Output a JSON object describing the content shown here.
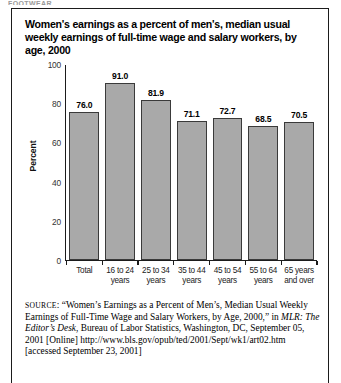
{
  "runhead": "FOOTWEAR",
  "card": {
    "title": "Women's earnings as a percent of men's, median usual weekly earnings of full-time wage and salary workers, by age, 2000"
  },
  "chart_data": {
    "type": "bar",
    "title": "Women's earnings as a percent of men's, median usual weekly earnings of full-time wage and salary workers, by age, 2000",
    "categories": [
      "Total",
      "16 to 24 years",
      "25 to 34 years",
      "35 to 44 years",
      "45 to 54 years",
      "55 to 64 years",
      "65 years and over"
    ],
    "category_lines": [
      [
        "Total",
        ""
      ],
      [
        "16 to 24",
        "years"
      ],
      [
        "25 to 34",
        "years"
      ],
      [
        "35 to 44",
        "years"
      ],
      [
        "45 to 54",
        "years"
      ],
      [
        "55 to 64",
        "years"
      ],
      [
        "65 years",
        "and over"
      ]
    ],
    "values": [
      76.0,
      91.0,
      81.9,
      71.1,
      72.7,
      68.5,
      70.5
    ],
    "value_labels": [
      "76.0",
      "91.0",
      "81.9",
      "71.1",
      "72.7",
      "68.5",
      "70.5"
    ],
    "xlabel": "",
    "ylabel": "Percent",
    "ylim": [
      0,
      100
    ],
    "yticks": [
      100,
      80,
      60,
      40,
      20,
      0
    ],
    "ytick_labels": [
      "100",
      "80",
      "60",
      "40",
      "20",
      "0"
    ],
    "grid": false,
    "legend": false,
    "bar_color": "#a9a9a9",
    "bar_edge_color": "#3a3a3a",
    "axis_color": "#1b1b1b"
  },
  "source": {
    "label": "SOURCE",
    "line1": ": “Women’s Earnings as a Percent of Men’s, Median Usual Weekly Earnings of Full-Time Wage and Salary Workers, by Age, 2000,” in ",
    "italic_title": "MLR: The Editor’s Desk",
    "line2": ", Bureau of Labor Statistics, Washington, DC, September 05, 2001 [Online] http://www.bls.gov/opub/ted/2001/Sept/wk1/art02.htm [accessed September 23, 2001]"
  }
}
